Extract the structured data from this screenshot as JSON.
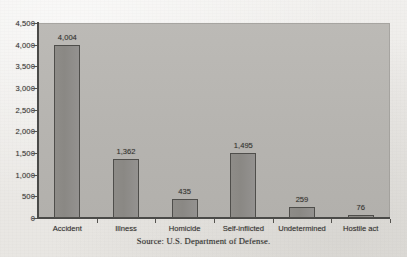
{
  "chart_data": {
    "type": "bar",
    "title": "",
    "subtitle": "",
    "xlabel": "",
    "ylabel": "",
    "categories": [
      "Accident",
      "Illness",
      "Homicide",
      "Self-inflicted",
      "Undetermined",
      "Hostile act"
    ],
    "values": [
      4004,
      1362,
      435,
      1495,
      259,
      76
    ],
    "value_labels": [
      "4,004",
      "1,362",
      "435",
      "1,495",
      "259",
      "76"
    ],
    "ylim": [
      0,
      4500
    ],
    "ytick_values": [
      0,
      500,
      1000,
      1500,
      2000,
      2500,
      3000,
      3500,
      4000,
      4500
    ],
    "ytick_labels": [
      "0",
      "500",
      "1,000",
      "1,500",
      "2,000",
      "2,500",
      "3,000",
      "3,500",
      "4,000",
      "4,500"
    ],
    "grid": false,
    "legend": false,
    "legend_position": "none",
    "series": [
      {
        "name": "Deaths",
        "values": [
          4004,
          1362,
          435,
          1495,
          259,
          76
        ]
      }
    ]
  },
  "caption": {
    "source": "Source: U.S. Department of Defense."
  },
  "colors": {
    "page_background": "#efeeec",
    "plot_background": "#b6b4b0",
    "bar_fill": "#8c8a86",
    "bar_border": "#4f4e4b",
    "axis": "#4a4a48",
    "text": "#33322f"
  }
}
